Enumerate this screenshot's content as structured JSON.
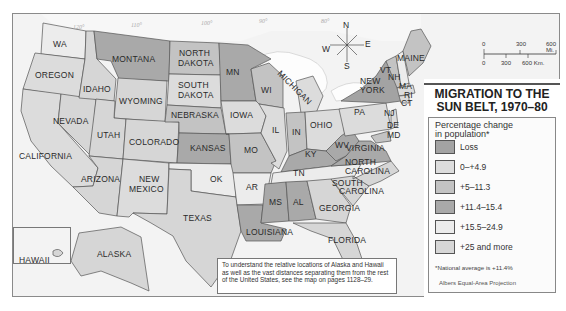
{
  "title": {
    "line1": "MIGRATION TO THE",
    "line2": "SUN BELT, 1970–80"
  },
  "legend": {
    "subtitle_line1": "Percentage change",
    "subtitle_line2": "in population*",
    "items": [
      {
        "label": "Loss",
        "color": "#a3a3a3"
      },
      {
        "label": "0–+4.9",
        "color": "#dcdcdc"
      },
      {
        "label": "+5–11.3",
        "color": "#c3c3c3"
      },
      {
        "label": "+11.4–15.4",
        "color": "#a9a9a9"
      },
      {
        "label": "+15.5–24.9",
        "color": "#ececec"
      },
      {
        "label": "+25 and more",
        "color": "#d6d6d6"
      }
    ],
    "note": "*National average is +11.4%",
    "projection": "Albers Equal-Area Projection"
  },
  "scale_bar": {
    "miles": [
      "0",
      "300",
      "600 Mi."
    ],
    "km": [
      "0",
      "300",
      "600 Km."
    ]
  },
  "compass": {
    "n": "N",
    "s": "S",
    "e": "E",
    "w": "W"
  },
  "note_box": "To understand the relative locations of Alaska and Hawaii as well as the vast distances separating them from the rest of the United States, see the map on pages 1128–29.",
  "graticule": [
    "120°",
    "110°",
    "100°",
    "90°",
    "80°",
    "70°",
    "30°",
    "170°",
    "150°",
    "100°",
    "70°",
    "20°",
    "160°"
  ],
  "states": {
    "wa": "WA",
    "oregon": "OREGON",
    "california": "CALIFORNIA",
    "nevada": "NEVADA",
    "idaho": "IDAHO",
    "montana": "MONTANA",
    "wyoming": "WYOMING",
    "utah": "UTAH",
    "colorado": "COLORADO",
    "arizona": "ARIZONA",
    "new_mexico_1": "NEW",
    "new_mexico_2": "MEXICO",
    "north_dakota_1": "NORTH",
    "north_dakota_2": "DAKOTA",
    "south_dakota_1": "SOUTH",
    "south_dakota_2": "DAKOTA",
    "nebraska": "NEBRASKA",
    "kansas": "KANSAS",
    "ok": "OK",
    "texas": "TEXAS",
    "mn": "MN",
    "iowa": "IOWA",
    "mo": "MO",
    "ar": "AR",
    "louisiana": "LOUISIANA",
    "wi": "WI",
    "il": "IL",
    "michigan": "MICHIGAN",
    "in": "IN",
    "ohio": "OHIO",
    "ky": "KY",
    "tn": "TN",
    "ms": "MS",
    "al": "AL",
    "georgia": "GEORGIA",
    "florida": "FLORIDA",
    "south_carolina_1": "SOUTH",
    "south_carolina_2": "CAROLINA",
    "north_carolina_1": "NORTH",
    "north_carolina_2": "CAROLINA",
    "virginia": "VIRGINIA",
    "wv": "WV",
    "pa": "PA",
    "new_york_1": "NEW",
    "new_york_2": "YORK",
    "vt": "VT",
    "nh": "NH",
    "maine": "MAINE",
    "ma": "MA",
    "ri": "RI",
    "ct": "CT",
    "nj": "NJ",
    "de": "DE",
    "md": "MD",
    "alaska": "ALASKA",
    "hawaii": "HAWAII"
  }
}
